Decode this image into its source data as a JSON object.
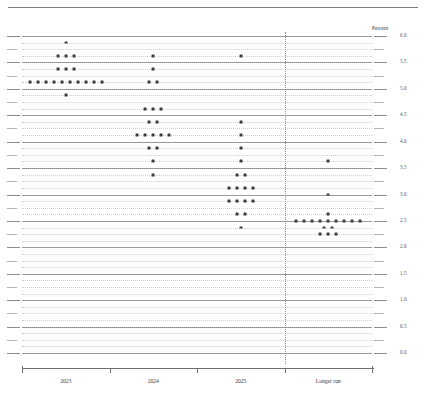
{
  "figure": {
    "unit_label": "Percent",
    "top_rule": true
  },
  "chart_data": {
    "type": "scatter",
    "title": "",
    "subtitle": "",
    "xlabel": "",
    "ylabel": "Percent",
    "ylim": [
      0.0,
      6.0
    ],
    "grid": true,
    "legend": false,
    "legend_position": "none",
    "categories": [
      "2023",
      "2024",
      "2025",
      "Longer run"
    ],
    "y_major_ticks": [
      "6.0",
      "5.5",
      "5.0",
      "4.5",
      "4.0",
      "3.5",
      "3.0",
      "2.5",
      "2.0",
      "1.5",
      "1.0",
      "0.5",
      "0.0"
    ],
    "y_major_values": [
      6.0,
      5.5,
      5.0,
      4.5,
      4.0,
      3.5,
      3.0,
      2.5,
      2.0,
      1.5,
      1.0,
      0.5,
      0.0
    ],
    "y_minor_values": [
      5.875,
      5.75,
      5.625,
      5.375,
      5.25,
      5.125,
      4.875,
      4.75,
      4.625,
      4.375,
      4.25,
      4.125,
      3.875,
      3.75,
      3.625,
      3.375,
      3.25,
      3.125,
      2.875,
      2.75,
      2.625,
      2.375,
      2.25,
      2.125,
      1.875,
      1.75,
      1.625,
      1.375,
      1.25,
      1.125,
      0.875,
      0.75,
      0.625,
      0.375,
      0.25,
      0.125
    ],
    "divider_before": "Longer run",
    "series": [
      {
        "name": "2023",
        "counts_by_level": [
          {
            "value": 5.875,
            "count": 1
          },
          {
            "value": 5.625,
            "count": 3
          },
          {
            "value": 5.375,
            "count": 3
          },
          {
            "value": 5.125,
            "count": 10
          },
          {
            "value": 4.875,
            "count": 1
          }
        ],
        "total": 18
      },
      {
        "name": "2024",
        "counts_by_level": [
          {
            "value": 5.625,
            "count": 1
          },
          {
            "value": 5.375,
            "count": 1
          },
          {
            "value": 5.125,
            "count": 2
          },
          {
            "value": 4.625,
            "count": 3
          },
          {
            "value": 4.375,
            "count": 2
          },
          {
            "value": 4.125,
            "count": 5
          },
          {
            "value": 3.875,
            "count": 2
          },
          {
            "value": 3.625,
            "count": 1
          },
          {
            "value": 3.375,
            "count": 1
          }
        ],
        "total": 18
      },
      {
        "name": "2025",
        "counts_by_level": [
          {
            "value": 5.625,
            "count": 1
          },
          {
            "value": 4.375,
            "count": 1
          },
          {
            "value": 4.125,
            "count": 1
          },
          {
            "value": 3.875,
            "count": 1
          },
          {
            "value": 3.625,
            "count": 1
          },
          {
            "value": 3.375,
            "count": 2
          },
          {
            "value": 3.125,
            "count": 4
          },
          {
            "value": 2.875,
            "count": 4
          },
          {
            "value": 2.625,
            "count": 2
          },
          {
            "value": 2.375,
            "count": 1
          }
        ],
        "total": 18
      },
      {
        "name": "Longer run",
        "counts_by_level": [
          {
            "value": 3.625,
            "count": 1
          },
          {
            "value": 3.0,
            "count": 1
          },
          {
            "value": 2.625,
            "count": 1
          },
          {
            "value": 2.5,
            "count": 9
          },
          {
            "value": 2.375,
            "count": 2
          },
          {
            "value": 2.25,
            "count": 3
          }
        ],
        "total": 17
      }
    ]
  }
}
